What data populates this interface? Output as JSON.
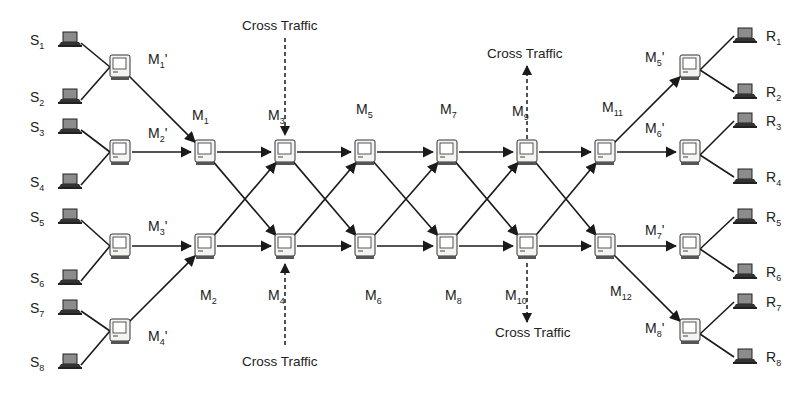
{
  "diagram": {
    "type": "network-topology",
    "colors": {
      "line": "#1a1a1a",
      "computer_fill": "#f4f4f0",
      "laptop_screen": "#8c8c8c"
    },
    "sources": [
      {
        "id": "S1",
        "base": "S",
        "sub": "1",
        "x": 70,
        "y": 40
      },
      {
        "id": "S2",
        "base": "S",
        "sub": "2",
        "x": 70,
        "y": 97
      },
      {
        "id": "S3",
        "base": "S",
        "sub": "3",
        "x": 70,
        "y": 127
      },
      {
        "id": "S4",
        "base": "S",
        "sub": "4",
        "x": 70,
        "y": 182
      },
      {
        "id": "S5",
        "base": "S",
        "sub": "5",
        "x": 70,
        "y": 217
      },
      {
        "id": "S6",
        "base": "S",
        "sub": "6",
        "x": 70,
        "y": 278
      },
      {
        "id": "S7",
        "base": "S",
        "sub": "7",
        "x": 70,
        "y": 308
      },
      {
        "id": "S8",
        "base": "S",
        "sub": "8",
        "x": 70,
        "y": 362
      }
    ],
    "receivers": [
      {
        "id": "R1",
        "base": "R",
        "sub": "1",
        "x": 745,
        "y": 36
      },
      {
        "id": "R2",
        "base": "R",
        "sub": "2",
        "x": 745,
        "y": 92
      },
      {
        "id": "R3",
        "base": "R",
        "sub": "3",
        "x": 745,
        "y": 121
      },
      {
        "id": "R4",
        "base": "R",
        "sub": "4",
        "x": 745,
        "y": 177
      },
      {
        "id": "R5",
        "base": "R",
        "sub": "5",
        "x": 745,
        "y": 217
      },
      {
        "id": "R6",
        "base": "R",
        "sub": "6",
        "x": 745,
        "y": 272
      },
      {
        "id": "R7",
        "base": "R",
        "sub": "7",
        "x": 745,
        "y": 302
      },
      {
        "id": "R8",
        "base": "R",
        "sub": "8",
        "x": 745,
        "y": 357
      }
    ],
    "edge_routers": [
      {
        "id": "M1p",
        "base": "M",
        "sub": "1",
        "prime": "'",
        "x": 120,
        "y": 67,
        "lx": 148,
        "ly": 64
      },
      {
        "id": "M2p",
        "base": "M",
        "sub": "2",
        "prime": "'",
        "x": 120,
        "y": 152,
        "lx": 148,
        "ly": 138
      },
      {
        "id": "M3p",
        "base": "M",
        "sub": "3",
        "prime": "'",
        "x": 120,
        "y": 246,
        "lx": 148,
        "ly": 231
      },
      {
        "id": "M4p",
        "base": "M",
        "sub": "4",
        "prime": "'",
        "x": 120,
        "y": 331,
        "lx": 148,
        "ly": 341
      },
      {
        "id": "M5p",
        "base": "M",
        "sub": "5",
        "prime": "'",
        "x": 690,
        "y": 67,
        "lx": 645,
        "ly": 62
      },
      {
        "id": "M6p",
        "base": "M",
        "sub": "6",
        "prime": "'",
        "x": 690,
        "y": 152,
        "lx": 645,
        "ly": 133
      },
      {
        "id": "M7p",
        "base": "M",
        "sub": "7",
        "prime": "'",
        "x": 690,
        "y": 246,
        "lx": 645,
        "ly": 235
      },
      {
        "id": "M8p",
        "base": "M",
        "sub": "8",
        "prime": "'",
        "x": 690,
        "y": 331,
        "lx": 645,
        "ly": 333
      }
    ],
    "core_routers": [
      {
        "id": "M1",
        "base": "M",
        "sub": "1",
        "x": 205,
        "y": 152,
        "lx": 192,
        "ly": 120
      },
      {
        "id": "M2",
        "base": "M",
        "sub": "2",
        "x": 205,
        "y": 246,
        "lx": 200,
        "ly": 300
      },
      {
        "id": "M3",
        "base": "M",
        "sub": "3",
        "x": 285,
        "y": 152,
        "lx": 268,
        "ly": 120
      },
      {
        "id": "M4",
        "base": "M",
        "sub": "4",
        "x": 285,
        "y": 246,
        "lx": 268,
        "ly": 300
      },
      {
        "id": "M5",
        "base": "M",
        "sub": "5",
        "x": 365,
        "y": 152,
        "lx": 356,
        "ly": 114
      },
      {
        "id": "M6",
        "base": "M",
        "sub": "6",
        "x": 365,
        "y": 246,
        "lx": 365,
        "ly": 300
      },
      {
        "id": "M7",
        "base": "M",
        "sub": "7",
        "x": 447,
        "y": 152,
        "lx": 440,
        "ly": 114
      },
      {
        "id": "M8",
        "base": "M",
        "sub": "8",
        "x": 447,
        "y": 246,
        "lx": 445,
        "ly": 300
      },
      {
        "id": "M9",
        "base": "M",
        "sub": "9",
        "x": 527,
        "y": 152,
        "lx": 512,
        "ly": 116
      },
      {
        "id": "M10",
        "base": "M",
        "sub": "10",
        "x": 527,
        "y": 246,
        "lx": 505,
        "ly": 300
      },
      {
        "id": "M11",
        "base": "M",
        "sub": "11",
        "x": 605,
        "y": 152,
        "lx": 602,
        "ly": 112
      },
      {
        "id": "M12",
        "base": "M",
        "sub": "12",
        "x": 605,
        "y": 246,
        "lx": 610,
        "ly": 296
      }
    ],
    "access_links": [
      [
        "S1",
        "M1p"
      ],
      [
        "S2",
        "M1p"
      ],
      [
        "S3",
        "M2p"
      ],
      [
        "S4",
        "M2p"
      ],
      [
        "S5",
        "M3p"
      ],
      [
        "S6",
        "M3p"
      ],
      [
        "S7",
        "M4p"
      ],
      [
        "S8",
        "M4p"
      ],
      [
        "M5p",
        "R1"
      ],
      [
        "M5p",
        "R2"
      ],
      [
        "M6p",
        "R3"
      ],
      [
        "M6p",
        "R4"
      ],
      [
        "M7p",
        "R5"
      ],
      [
        "M7p",
        "R6"
      ],
      [
        "M8p",
        "R7"
      ],
      [
        "M8p",
        "R8"
      ]
    ],
    "directed_links": [
      [
        "M1p",
        "M1"
      ],
      [
        "M2p",
        "M1"
      ],
      [
        "M3p",
        "M2"
      ],
      [
        "M4p",
        "M2"
      ],
      [
        "M1",
        "M3"
      ],
      [
        "M1",
        "M4"
      ],
      [
        "M2",
        "M3"
      ],
      [
        "M2",
        "M4"
      ],
      [
        "M3",
        "M5"
      ],
      [
        "M3",
        "M6"
      ],
      [
        "M4",
        "M5"
      ],
      [
        "M4",
        "M6"
      ],
      [
        "M5",
        "M7"
      ],
      [
        "M5",
        "M8"
      ],
      [
        "M6",
        "M7"
      ],
      [
        "M6",
        "M8"
      ],
      [
        "M7",
        "M9"
      ],
      [
        "M7",
        "M10"
      ],
      [
        "M8",
        "M9"
      ],
      [
        "M8",
        "M10"
      ],
      [
        "M9",
        "M11"
      ],
      [
        "M9",
        "M12"
      ],
      [
        "M10",
        "M11"
      ],
      [
        "M10",
        "M12"
      ],
      [
        "M11",
        "M5p"
      ],
      [
        "M11",
        "M6p"
      ],
      [
        "M12",
        "M7p"
      ],
      [
        "M12",
        "M8p"
      ]
    ],
    "cross_traffic": [
      {
        "label": "Cross Traffic",
        "node": "M3",
        "direction": "in",
        "tx": 242,
        "ty": 30,
        "x1": 285,
        "y1": 38,
        "x2": 285,
        "y2": 135
      },
      {
        "label": "Cross Traffic",
        "node": "M4",
        "direction": "in",
        "tx": 242,
        "ty": 366,
        "x1": 285,
        "y1": 345,
        "x2": 285,
        "y2": 264
      },
      {
        "label": "Cross Traffic",
        "node": "M9",
        "direction": "out",
        "tx": 487,
        "ty": 58,
        "x1": 527,
        "y1": 139,
        "x2": 527,
        "y2": 66
      },
      {
        "label": "Cross Traffic",
        "node": "M10",
        "direction": "out",
        "tx": 495,
        "ty": 337,
        "x1": 527,
        "y1": 263,
        "x2": 527,
        "y2": 322
      }
    ]
  }
}
